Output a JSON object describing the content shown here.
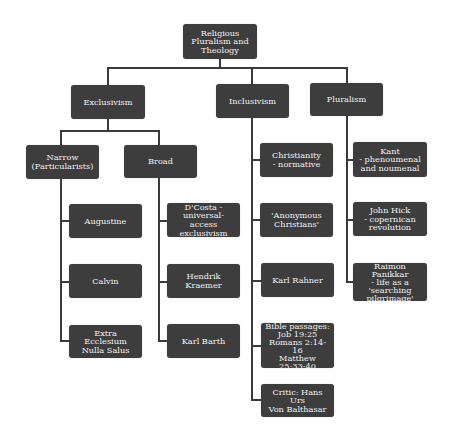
{
  "diagram": {
    "type": "hierarchy",
    "colors": {
      "node_fill": "#3d3d3d",
      "node_text": "#f2f2f2",
      "connector": "#3a3a3a",
      "background": "#ffffff"
    },
    "root": {
      "label": "Religious\nPluralism and\nTheology"
    },
    "categories": [
      {
        "label": "Exclusivism",
        "subcategories": [
          {
            "label": "Narrow\n(Particularists)",
            "items": [
              "Augustine",
              "Calvin",
              "Extra Ecclesium\nNulla Salus"
            ]
          },
          {
            "label": "Broad",
            "items": [
              "D'Costa -\nuniversal-access\nexclusivism",
              "Hendrik\nKraemer",
              "Karl Barth"
            ]
          }
        ]
      },
      {
        "label": "Inclusivism",
        "items": [
          "Christianity\n- normative",
          "'Anonymous\nChristians'",
          "Karl Rahner",
          "Bible passages:\nJob 19:25\nRomans 2:14-16\nMatthew\n25:33-40",
          "Critic: Hans Urs\nVon Balthasar"
        ]
      },
      {
        "label": "Pluralism",
        "items": [
          "Kant\n- phenoumenal\nand noumenal",
          "John Hick\n- copernican\nrevolution",
          "Raimon Panikkar\n- life as a\n'searching\npilgrimage'"
        ]
      }
    ]
  }
}
